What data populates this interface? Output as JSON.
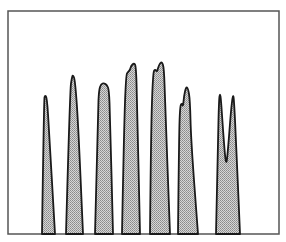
{
  "chart_data": {
    "type": "area",
    "title": "",
    "xlabel": "",
    "ylabel": "",
    "grid": false,
    "legend": null,
    "frame": {
      "x0": 8,
      "y0": 11,
      "x1": 279,
      "y1": 234
    },
    "colors": {
      "fill": "#bdbdbd",
      "stroke": "#1a1a1a",
      "frame": "#555555",
      "background": "#ffffff"
    },
    "peaks": [
      {
        "name": "peak-1",
        "points": [
          [
            42,
            234
          ],
          [
            44,
            100
          ],
          [
            45,
            95
          ],
          [
            47,
            98
          ],
          [
            49,
            130
          ],
          [
            55,
            234
          ]
        ]
      },
      {
        "name": "peak-2",
        "points": [
          [
            66,
            234
          ],
          [
            70,
            90
          ],
          [
            72,
            77
          ],
          [
            73,
            75
          ],
          [
            75,
            80
          ],
          [
            78,
            120
          ],
          [
            83,
            234
          ]
        ]
      },
      {
        "name": "peak-3",
        "points": [
          [
            95,
            234
          ],
          [
            98,
            110
          ],
          [
            99,
            90
          ],
          [
            101,
            84
          ],
          [
            104,
            83
          ],
          [
            107,
            85
          ],
          [
            109,
            90
          ],
          [
            110,
            115
          ],
          [
            113,
            234
          ]
        ]
      },
      {
        "name": "peak-4",
        "points": [
          [
            122,
            234
          ],
          [
            124,
            130
          ],
          [
            126,
            75
          ],
          [
            128,
            72
          ],
          [
            130,
            70
          ],
          [
            131,
            66
          ],
          [
            134,
            63
          ],
          [
            136,
            66
          ],
          [
            137,
            100
          ],
          [
            140,
            234
          ]
        ]
      },
      {
        "name": "peak-5",
        "points": [
          [
            150,
            234
          ],
          [
            151,
            130
          ],
          [
            153,
            73
          ],
          [
            155,
            69
          ],
          [
            157,
            72
          ],
          [
            158,
            68
          ],
          [
            160,
            63
          ],
          [
            162,
            62
          ],
          [
            164,
            68
          ],
          [
            165,
            100
          ],
          [
            170,
            234
          ]
        ]
      },
      {
        "name": "peak-6",
        "points": [
          [
            178,
            234
          ],
          [
            179,
            140
          ],
          [
            180,
            106
          ],
          [
            182,
            103
          ],
          [
            183,
            107
          ],
          [
            184,
            96
          ],
          [
            186,
            87
          ],
          [
            188,
            88
          ],
          [
            190,
            100
          ],
          [
            191,
            140
          ],
          [
            198,
            234
          ]
        ]
      },
      {
        "name": "peak-7",
        "points": [
          [
            216,
            234
          ],
          [
            218,
            140
          ],
          [
            219,
            100
          ],
          [
            220,
            93
          ],
          [
            221,
            100
          ],
          [
            223,
            130
          ],
          [
            226,
            168
          ],
          [
            228,
            150
          ],
          [
            231,
            110
          ],
          [
            233,
            94
          ],
          [
            234,
            100
          ],
          [
            236,
            140
          ],
          [
            240,
            234
          ]
        ]
      }
    ],
    "relative_heights": [
      0.62,
      0.71,
      0.67,
      0.77,
      0.77,
      0.66,
      0.63
    ]
  }
}
